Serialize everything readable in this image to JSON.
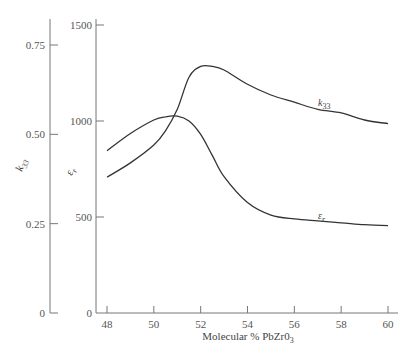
{
  "chart_data": {
    "type": "line",
    "title": "",
    "xlabel": "Molecular % PbZr0",
    "xlabel_subscript": "3",
    "xlim": [
      48,
      60
    ],
    "x_ticks": [
      "48",
      "50",
      "52",
      "54",
      "56",
      "58",
      "60"
    ],
    "grid": false,
    "axes": [
      {
        "id": "k33",
        "label": "k",
        "label_subscript": "33",
        "position": "far-left",
        "ylim": [
          0,
          0.75
        ],
        "ticks": [
          "0",
          "0.25",
          "0.50",
          "0.75"
        ]
      },
      {
        "id": "er",
        "label": "ε",
        "label_subscript": "r",
        "position": "left",
        "ylim": [
          0,
          1500
        ],
        "ticks": [
          "0",
          "500",
          "1000",
          "1500"
        ]
      }
    ],
    "series": [
      {
        "name": "k33",
        "label": "k",
        "label_subscript": "33",
        "axis": "k33",
        "x": [
          48,
          49,
          50,
          50.5,
          51,
          51.5,
          52,
          52.5,
          53,
          54,
          55,
          56,
          57,
          58,
          59,
          60
        ],
        "values": [
          0.38,
          0.42,
          0.47,
          0.51,
          0.57,
          0.66,
          0.69,
          0.69,
          0.68,
          0.64,
          0.61,
          0.59,
          0.57,
          0.56,
          0.54,
          0.53
        ]
      },
      {
        "name": "εr",
        "label": "ε",
        "label_subscript": "r",
        "axis": "er",
        "x": [
          48,
          49,
          50,
          50.5,
          51,
          51.5,
          52,
          52.5,
          53,
          54,
          55,
          56,
          57,
          58,
          59,
          60
        ],
        "values": [
          845,
          935,
          1005,
          1022,
          1025,
          1000,
          930,
          820,
          710,
          575,
          510,
          490,
          480,
          470,
          460,
          455
        ]
      }
    ],
    "annotations": [
      {
        "text": "k",
        "subscript": "33",
        "near": "k33 curve at x≈56.8"
      },
      {
        "text": "ε",
        "subscript": "r",
        "near": "εr curve at x≈56.8"
      }
    ]
  },
  "labels": {
    "x_title_main": "Molecular % PbZr0",
    "x_title_sub": "3",
    "k_axis_main": "k",
    "k_axis_sub": "33",
    "e_axis_main": "ε",
    "e_axis_sub": "r",
    "k_curve_main": "k",
    "k_curve_sub": "33",
    "e_curve_main": "ε",
    "e_curve_sub": "r"
  }
}
